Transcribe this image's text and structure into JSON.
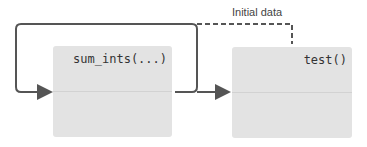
{
  "nodes": [
    {
      "id": "sum_ints",
      "label": "sum_ints(...)"
    },
    {
      "id": "test",
      "label": "test()"
    }
  ],
  "edges": [
    {
      "from": "sum_ints",
      "to": "sum_ints",
      "style": "solid",
      "kind": "loop"
    },
    {
      "from": "sum_ints",
      "to": "test",
      "style": "solid"
    },
    {
      "from": "initial-data",
      "to": "test",
      "style": "dashed"
    }
  ],
  "annotation": {
    "label": "Initial data"
  },
  "colors": {
    "box": "#e3e3e3",
    "line": "#555555"
  }
}
